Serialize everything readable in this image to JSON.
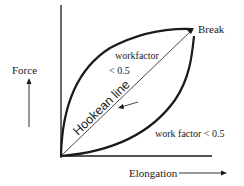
{
  "diagram": {
    "type": "force-elongation curve",
    "labels": {
      "y_axis": "Force",
      "x_axis": "Elongation",
      "break": "Break",
      "upper_workfactor_line1": "workfactor",
      "upper_workfactor_line2": "< 0.5",
      "lower_workfactor": "work factor < 0.5",
      "hookean": "Hookean line"
    },
    "colors": {
      "line": "#1a1a1a",
      "background": "#ffffff"
    }
  }
}
